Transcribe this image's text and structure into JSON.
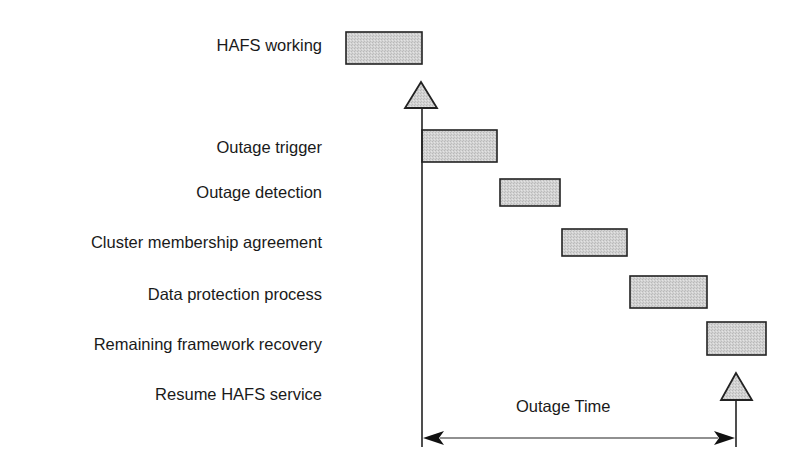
{
  "diagram": {
    "steps": [
      {
        "label": "HAFS working",
        "marker": "bar"
      },
      {
        "label": "Outage trigger",
        "marker": "bar"
      },
      {
        "label": "Outage detection",
        "marker": "bar"
      },
      {
        "label": "Cluster membership agreement",
        "marker": "bar"
      },
      {
        "label": "Data protection process",
        "marker": "bar"
      },
      {
        "label": "Remaining framework recovery",
        "marker": "bar"
      },
      {
        "label": "Resume HAFS service",
        "marker": "triangle"
      }
    ],
    "span_label": "Outage Time",
    "colors": {
      "bar_fill": "#cfcfcf",
      "stroke": "#222222",
      "triangle_fill": "#c8c8c8"
    }
  }
}
